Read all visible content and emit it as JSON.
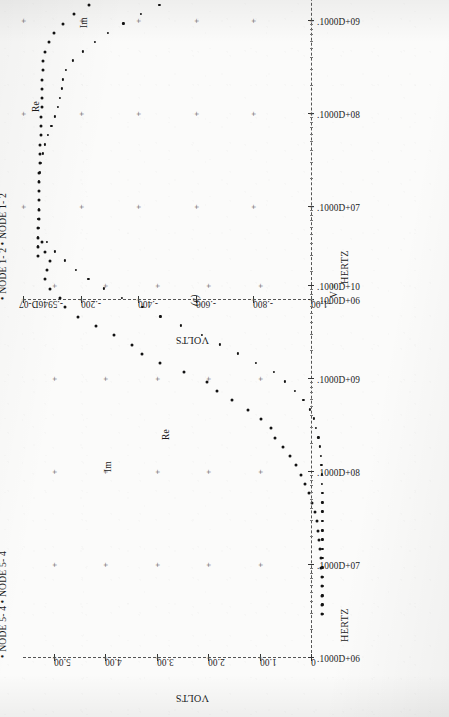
{
  "page": {
    "background": "#fbfbfa",
    "ink": "#111111"
  },
  "figures": [
    {
      "id": "d",
      "caption": "(d)",
      "legend": {
        "bullet": "•",
        "entries": [
          "NODE 1- 2",
          "NODE 1- 2"
        ],
        "text": "• NODE 1- 2  • NODE 1- 2"
      },
      "y_axis": {
        "title": "VOLTS",
        "ticks": [
          "-1.00",
          "-.800",
          "-.600",
          "-.400",
          "-.200",
          "-.5946D-07"
        ],
        "values": [
          -1.0,
          -0.8,
          -0.6,
          -0.4,
          -0.2,
          0.0
        ],
        "min": -1.0,
        "max": 0.0
      },
      "x_axis": {
        "title": "HERTZ",
        "ticks": [
          ".1000D+06",
          ".1000D+07",
          ".1000D+08",
          ".1000D+09",
          ".1000D+10"
        ],
        "values": [
          1000000.0,
          10000000.0,
          100000000.0,
          1000000000.0,
          10000000000.0
        ],
        "scale": "log",
        "min": 1000000,
        "max": 10000000000
      },
      "footer_mark": "V =",
      "trace_labels": {
        "re": "Re",
        "im": "Im"
      }
    },
    {
      "id": "c",
      "caption": "(c)",
      "legend": {
        "bullet": "•",
        "entries": [
          "NODE 5- 4",
          "NODE 5- 4"
        ],
        "text": "• NODE 5- 4  • NODE 5- 4"
      },
      "y_axis": {
        "title": "VOLTS",
        "ticks": [
          "0",
          "1.00",
          "2.00",
          "3.00",
          "4.00",
          "5.00"
        ],
        "values": [
          0,
          1,
          2,
          3,
          4,
          5
        ],
        "min": 0,
        "max": 5.6
      },
      "x_axis": {
        "title": "HERTZ",
        "ticks": [
          ".1000D+06",
          ".1000D+07",
          ".1000D+08",
          ".1000D+09",
          ".1000D+10"
        ],
        "values": [
          1000000.0,
          10000000.0,
          100000000.0,
          1000000000.0,
          10000000000.0
        ],
        "scale": "log",
        "min": 1000000,
        "max": 10000000000
      },
      "footer_mark": "V =",
      "trace_labels": {
        "re": "Re",
        "im": "Im"
      }
    }
  ],
  "chart_data": [
    {
      "type": "scatter",
      "id": "d",
      "title": "(d)",
      "xlabel": "HERTZ",
      "ylabel": "VOLTS",
      "xscale": "log",
      "xlim": [
        1000000,
        10000000000
      ],
      "ylim": [
        -1.0,
        0.0
      ],
      "xticklabels": [
        ".1000D+06",
        ".1000D+07",
        ".1000D+08",
        ".1000D+09",
        ".1000D+10"
      ],
      "yticklabels": [
        "-1.00",
        "-.800",
        "-.600",
        "-.400",
        "-.200",
        "-.5946D-07"
      ],
      "grid": "plus-marks",
      "legend": [
        "NODE 1- 2",
        "NODE 1- 2"
      ],
      "annotations": [
        {
          "text": "Re",
          "x": 300000000,
          "y": -0.02
        },
        {
          "text": "Im",
          "x": 2500000000,
          "y": -0.19
        }
      ],
      "series": [
        {
          "name": "Re",
          "label": "NODE 1- 2",
          "marker": "dot",
          "x": [
            1000000.0,
            1260000.0,
            1580000.0,
            2000000.0,
            2500000.0,
            3160000.0,
            4000000.0,
            5000000.0,
            6300000.0,
            7900000.0,
            10000000.0,
            12600000.0,
            15800000.0,
            20000000.0,
            25000000.0,
            31600000.0,
            40000000.0,
            50000000.0,
            63000000.0,
            79000000.0,
            100000000.0,
            126000000.0,
            158000000.0,
            200000000.0,
            250000000.0,
            316000000.0,
            400000000.0,
            500000000.0,
            630000000.0,
            790000000.0,
            1000000000.0,
            1260000000.0,
            1580000000.0,
            2000000000.0,
            2500000000.0,
            3160000000.0,
            4000000000.0,
            5000000000.0,
            6300000000.0,
            7900000000.0,
            10000000000.0
          ],
          "y": [
            -0.005,
            -0.005,
            -0.005,
            -0.005,
            -0.006,
            -0.006,
            -0.006,
            -0.007,
            -0.007,
            -0.008,
            -0.009,
            -0.01,
            -0.012,
            -0.013,
            -0.014,
            -0.015,
            -0.016,
            -0.017,
            -0.018,
            -0.019,
            -0.02,
            -0.022,
            -0.028,
            -0.04,
            -0.06,
            -0.09,
            -0.13,
            -0.18,
            -0.23,
            -0.275,
            -0.3,
            -0.29,
            -0.26,
            -0.225,
            -0.19,
            -0.16,
            -0.135,
            -0.115,
            -0.1,
            -0.092,
            -0.088
          ]
        },
        {
          "name": "Im",
          "label": "NODE 1- 2",
          "marker": "dot",
          "x": [
            1000000.0,
            1260000.0,
            1580000.0,
            2000000.0,
            2500000.0,
            3160000.0,
            4000000.0,
            5000000.0,
            6300000.0,
            7900000.0,
            10000000.0,
            12600000.0,
            15800000.0,
            20000000.0,
            25000000.0,
            31600000.0,
            40000000.0,
            50000000.0,
            63000000.0,
            79000000.0,
            100000000.0,
            126000000.0,
            158000000.0,
            200000000.0,
            250000000.0,
            316000000.0,
            400000000.0,
            500000000.0,
            630000000.0,
            790000000.0,
            1000000000.0,
            1260000000.0,
            1580000000.0,
            2000000000.0,
            2500000000.0,
            3160000000.0,
            4000000000.0,
            5000000000.0,
            6300000000.0,
            7900000000.0,
            10000000000.0
          ],
          "y": [
            -0.004,
            -0.004,
            -0.004,
            -0.005,
            -0.005,
            -0.006,
            -0.006,
            -0.007,
            -0.008,
            -0.01,
            -0.014,
            -0.02,
            -0.028,
            -0.038,
            -0.05,
            -0.062,
            -0.072,
            -0.08,
            -0.086,
            -0.09,
            -0.1,
            -0.125,
            -0.16,
            -0.2,
            -0.245,
            -0.3,
            -0.36,
            -0.425,
            -0.48,
            -0.525,
            -0.56,
            -0.58,
            -0.592,
            -0.598,
            -0.6,
            -0.6,
            -0.6,
            -0.6,
            -0.6,
            -0.6,
            -0.6
          ]
        }
      ]
    },
    {
      "type": "scatter",
      "id": "c",
      "title": "(c)",
      "xlabel": "HERTZ",
      "ylabel": "VOLTS",
      "xscale": "log",
      "xlim": [
        1000000,
        10000000000
      ],
      "ylim": [
        0,
        5.6
      ],
      "xticklabels": [
        ".1000D+06",
        ".1000D+07",
        ".1000D+08",
        ".1000D+09",
        ".1000D+10"
      ],
      "yticklabels": [
        "0",
        "1.00",
        "2.00",
        "3.00",
        "4.00",
        "5.00"
      ],
      "grid": "plus-marks",
      "legend": [
        "NODE 5- 4",
        "NODE 5- 4"
      ],
      "annotations": [
        {
          "text": "Im",
          "x": 550000000,
          "y": 3.55
        },
        {
          "text": "Re",
          "x": 1100000000,
          "y": 2.45
        }
      ],
      "series": [
        {
          "name": "Im",
          "label": "NODE 5- 4",
          "marker": "dot",
          "x": [
            1000000.0,
            1260000.0,
            1580000.0,
            2000000.0,
            2500000.0,
            3160000.0,
            4000000.0,
            5000000.0,
            6300000.0,
            7900000.0,
            10000000.0,
            12600000.0,
            15800000.0,
            20000000.0,
            25000000.0,
            31600000.0,
            40000000.0,
            50000000.0,
            63000000.0,
            79000000.0,
            100000000.0,
            126000000.0,
            158000000.0,
            200000000.0,
            250000000.0,
            316000000.0,
            400000000.0,
            500000000.0,
            630000000.0,
            790000000.0,
            1000000000.0,
            1260000000.0,
            1580000000.0,
            2000000000.0,
            2500000000.0,
            3160000000.0,
            4000000000.0,
            5000000000.0,
            6300000000.0,
            7900000000.0,
            10000000000.0
          ],
          "y": [
            0.05,
            0.05,
            0.05,
            0.06,
            0.06,
            0.07,
            0.08,
            0.09,
            0.11,
            0.13,
            0.16,
            0.2,
            0.25,
            0.31,
            0.38,
            0.46,
            0.56,
            0.68,
            0.82,
            0.98,
            1.05,
            1.25,
            1.5,
            1.8,
            2.1,
            2.3,
            2.75,
            3.2,
            3.55,
            3.75,
            4.1,
            4.45,
            4.8,
            5.05,
            5.15,
            5.35,
            5.45,
            5.4,
            5.35,
            5.45,
            5.5
          ]
        },
        {
          "name": "Re",
          "label": "NODE 5- 4",
          "marker": "dot",
          "x": [
            1000000.0,
            1260000.0,
            1580000.0,
            2000000.0,
            2500000.0,
            3160000.0,
            4000000.0,
            5000000.0,
            6300000.0,
            7900000.0,
            10000000.0,
            12600000.0,
            15800000.0,
            20000000.0,
            25000000.0,
            31600000.0,
            40000000.0,
            50000000.0,
            63000000.0,
            79000000.0,
            100000000.0,
            126000000.0,
            158000000.0,
            200000000.0,
            250000000.0,
            316000000.0,
            400000000.0,
            500000000.0,
            630000000.0,
            790000000.0,
            1000000000.0,
            1260000000.0,
            1580000000.0,
            2000000000.0,
            2500000000.0,
            3160000000.0,
            4000000000.0,
            5000000000.0,
            6300000000.0,
            7900000000.0,
            10000000000.0
          ],
          "y": [
            0.05,
            0.05,
            0.05,
            0.05,
            0.05,
            0.05,
            0.05,
            0.05,
            0.05,
            0.05,
            0.05,
            0.05,
            0.05,
            0.05,
            0.06,
            0.06,
            0.07,
            0.08,
            0.1,
            0.13,
            0.17,
            0.22,
            0.3,
            0.42,
            0.58,
            0.78,
            1.0,
            1.35,
            1.7,
            2.05,
            2.4,
            2.8,
            3.2,
            3.55,
            3.95,
            4.3,
            4.6,
            4.85,
            5.05,
            5.25,
            5.4
          ]
        }
      ]
    }
  ]
}
